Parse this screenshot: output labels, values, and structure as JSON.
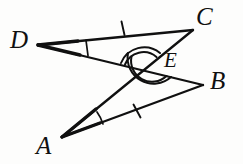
{
  "figure": {
    "kind": "euclidean-geometry-diagram",
    "background_color": "#fdfdfc",
    "stroke_color": "#101010",
    "canvas": {
      "width": 243,
      "height": 164
    },
    "points": [
      {
        "id": "D",
        "label": "D",
        "x": 38,
        "y": 45,
        "label_x": 10,
        "label_y": 27,
        "size": "big"
      },
      {
        "id": "C",
        "label": "C",
        "x": 193,
        "y": 30,
        "label_x": 196,
        "label_y": 4,
        "size": "big"
      },
      {
        "id": "E",
        "label": "E",
        "x": 145,
        "y": 70,
        "label_x": 164,
        "label_y": 50,
        "size": "mid"
      },
      {
        "id": "B",
        "label": "B",
        "x": 203,
        "y": 85,
        "label_x": 210,
        "label_y": 68,
        "size": "big"
      },
      {
        "id": "A",
        "label": "A",
        "x": 62,
        "y": 137,
        "label_x": 36,
        "label_y": 133,
        "size": "big"
      }
    ],
    "segments": [
      {
        "id": "DC",
        "from": "D",
        "to": "C",
        "path": "M 38 45 L 193 30"
      },
      {
        "id": "DB",
        "from": "D",
        "to": "B",
        "path": "M 38 45 L 203 85",
        "through": "E"
      },
      {
        "id": "AC",
        "from": "A",
        "to": "C",
        "path": "M 62 137 L 193 30",
        "through": "E"
      },
      {
        "id": "AB",
        "from": "A",
        "to": "B",
        "path": "M 62 137 L 203 85"
      }
    ],
    "tick_marks": [
      {
        "id": "tick-DC",
        "on_segment": "DC",
        "count": 1,
        "x": 123,
        "y": 28,
        "angle": 84
      },
      {
        "id": "tick-AB",
        "on_segment": "AB",
        "count": 1,
        "x": 137,
        "y": 111,
        "angle": 70
      }
    ],
    "angle_marks": [
      {
        "id": "angle-D",
        "at": "D",
        "arcs": 1,
        "between": [
          "DC",
          "DB"
        ]
      },
      {
        "id": "angle-A",
        "at": "A",
        "arcs": 1,
        "between": [
          "AC",
          "AB"
        ]
      },
      {
        "id": "angle-DEC",
        "at": "E",
        "arcs": 2,
        "between": [
          "ED",
          "EC"
        ],
        "position": "upper"
      },
      {
        "id": "angle-AEB",
        "at": "E",
        "arcs": 2,
        "between": [
          "EA",
          "EB"
        ],
        "position": "lower"
      }
    ]
  }
}
